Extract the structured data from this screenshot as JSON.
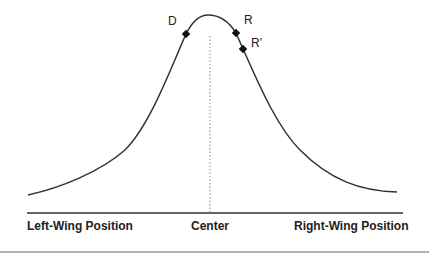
{
  "diagram": {
    "type": "distribution-curve",
    "axis": {
      "left_label": "Left-Wing Position",
      "center_label": "Center",
      "right_label": "Right-Wing Position"
    },
    "points": [
      {
        "id": "D",
        "label": "D",
        "side": "left of center"
      },
      {
        "id": "R",
        "label": "R",
        "side": "right of center"
      },
      {
        "id": "R_prime",
        "label": "R'",
        "side": "right of R"
      }
    ],
    "colors": {
      "curve": "#333333",
      "baseline": "#333333",
      "center_line": "#888888",
      "bottom_rule": "#999999"
    }
  }
}
